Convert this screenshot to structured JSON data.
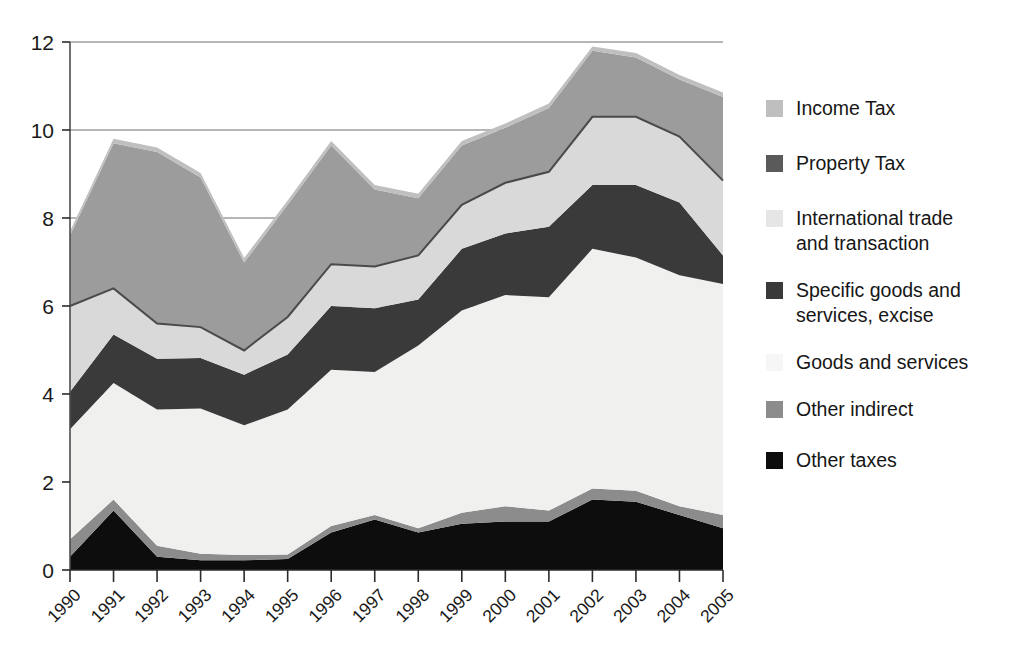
{
  "chart_data": {
    "type": "area",
    "stacked": true,
    "title": "",
    "subtitle": "",
    "xlabel": "",
    "ylabel": "",
    "categories": [
      "1990",
      "1991",
      "1992",
      "1993",
      "1994",
      "1995",
      "1996",
      "1997",
      "1998",
      "1999",
      "2000",
      "2001",
      "2002",
      "2003",
      "2004",
      "2005"
    ],
    "x": [
      1990,
      1991,
      1992,
      1993,
      1994,
      1995,
      1996,
      1997,
      1998,
      1999,
      2000,
      2001,
      2002,
      2003,
      2004,
      2005
    ],
    "ylim": [
      0,
      12
    ],
    "yticks": [
      0,
      2,
      4,
      6,
      8,
      10,
      12
    ],
    "ytick_labels": [
      "0",
      "2",
      "4",
      "6",
      "8",
      "10",
      "12"
    ],
    "grid": true,
    "grid_axis": "y",
    "legend_position": "right",
    "stack_order_bottom_to_top": [
      "Other taxes",
      "Other indirect",
      "Goods and services",
      "Specific goods and services, excise",
      "International trade and transaction",
      "Property Tax",
      "Income Tax"
    ],
    "series": [
      {
        "name": "Other taxes",
        "color": "#0d0d0d",
        "values": [
          0.3,
          1.35,
          0.3,
          0.22,
          0.22,
          0.25,
          0.85,
          1.15,
          0.85,
          1.05,
          1.1,
          1.1,
          1.6,
          1.55,
          1.25,
          0.95
        ]
      },
      {
        "name": "Other indirect",
        "color": "#8c8c8c",
        "values": [
          0.4,
          0.25,
          0.25,
          0.15,
          0.12,
          0.1,
          0.15,
          0.1,
          0.1,
          0.25,
          0.35,
          0.25,
          0.25,
          0.25,
          0.2,
          0.3
        ]
      },
      {
        "name": "Goods and services",
        "color": "#f0f0ef",
        "values": [
          2.5,
          2.65,
          3.1,
          3.3,
          2.95,
          3.3,
          3.55,
          3.25,
          4.15,
          4.6,
          4.8,
          4.85,
          5.45,
          5.3,
          5.25,
          5.25
        ]
      },
      {
        "name": "Specific goods and services, excise",
        "color": "#3a3a3a",
        "values": [
          0.85,
          1.1,
          1.15,
          1.15,
          1.15,
          1.25,
          1.45,
          1.45,
          1.05,
          1.4,
          1.4,
          1.6,
          1.45,
          1.65,
          1.65,
          0.65
        ]
      },
      {
        "name": "International trade and transaction",
        "color": "#d9d9d9",
        "values": [
          1.95,
          1.05,
          0.8,
          0.7,
          0.55,
          0.85,
          0.95,
          0.95,
          1.0,
          1.0,
          1.15,
          1.25,
          1.55,
          1.55,
          1.5,
          1.7
        ]
      },
      {
        "name": "Property Tax",
        "color": "#9c9c9c",
        "values": [
          1.6,
          3.3,
          3.9,
          3.4,
          2.0,
          2.55,
          2.7,
          1.75,
          1.3,
          1.35,
          1.25,
          1.45,
          1.5,
          1.35,
          1.3,
          1.9
        ]
      },
      {
        "name": "Income Tax",
        "color": "#bfbfbf",
        "values": [
          0.1,
          0.1,
          0.1,
          0.1,
          0.1,
          0.1,
          0.1,
          0.1,
          0.1,
          0.1,
          0.1,
          0.1,
          0.1,
          0.1,
          0.1,
          0.1
        ]
      }
    ],
    "stack_totals": [
      7.6,
      9.3,
      9.35,
      8.9,
      7.9,
      8.3,
      9.65,
      8.65,
      8.45,
      9.65,
      10.05,
      10.5,
      11.75,
      11.65,
      11.35,
      11.15
    ]
  },
  "legend": {
    "items": [
      {
        "label": "Income Tax",
        "swatch": "#bfbfbf"
      },
      {
        "label": "Property Tax",
        "swatch": "#5a5a5a"
      },
      {
        "label": "International trade\nand transaction",
        "swatch": "#e6e6e6"
      },
      {
        "label": "Specific goods and\nservices, excise",
        "swatch": "#3a3a3a"
      },
      {
        "label": "Goods and services",
        "swatch": "#f6f6f6"
      },
      {
        "label": "Other indirect",
        "swatch": "#8c8c8c"
      },
      {
        "label": "Other taxes",
        "swatch": "#0d0d0d"
      }
    ]
  },
  "axes": {
    "y_tick_labels": [
      "12",
      "10",
      "8",
      "6",
      "4",
      "2",
      "0"
    ],
    "x_tick_labels": [
      "1990",
      "1991",
      "1992",
      "1993",
      "1994",
      "1995",
      "1996",
      "1997",
      "1998",
      "1999",
      "2000",
      "2001",
      "2002",
      "2003",
      "2004",
      "2005"
    ]
  }
}
